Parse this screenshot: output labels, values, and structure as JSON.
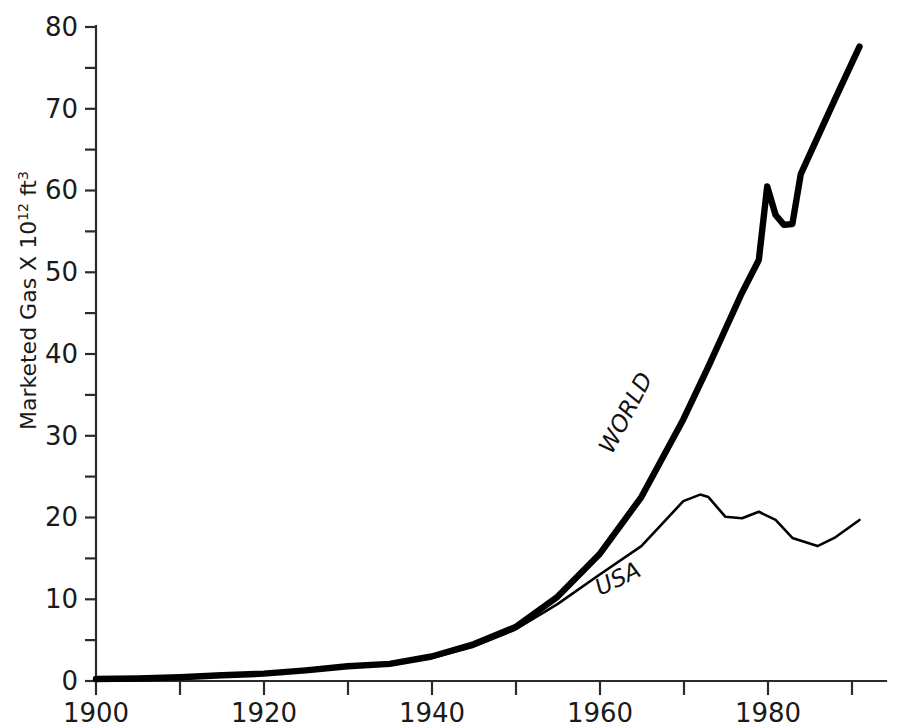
{
  "chart_data": {
    "type": "line",
    "title": "",
    "xlabel": "",
    "ylabel": "Marketed Gas X 10^12 ft^3",
    "ylabel_prefix": "Marketed Gas X 10",
    "ylabel_exponent": "12",
    "ylabel_unit": " ft",
    "ylabel_unit_exponent": "3",
    "xlim": [
      1900,
      1994
    ],
    "ylim": [
      0,
      80
    ],
    "grid": false,
    "legend_position": "inline-annotation",
    "x_ticks": [
      1900,
      1910,
      1920,
      1930,
      1940,
      1950,
      1960,
      1970,
      1980,
      1990
    ],
    "x_tick_labels": [
      "1900",
      "",
      "1920",
      "",
      "1940",
      "",
      "1960",
      "",
      "1980",
      ""
    ],
    "y_ticks": [
      0,
      5,
      10,
      15,
      20,
      25,
      30,
      35,
      40,
      45,
      50,
      55,
      60,
      65,
      70,
      75,
      80
    ],
    "y_tick_labels": [
      "0",
      "",
      "10",
      "",
      "20",
      "",
      "30",
      "",
      "40",
      "",
      "50",
      "",
      "60",
      "",
      "70",
      "",
      "80"
    ],
    "series": [
      {
        "name": "WORLD",
        "label": "WORLD",
        "style": "thick",
        "x": [
          1900,
          1905,
          1910,
          1915,
          1920,
          1925,
          1930,
          1935,
          1940,
          1945,
          1950,
          1955,
          1960,
          1965,
          1970,
          1973,
          1975,
          1977,
          1979,
          1980,
          1981,
          1982,
          1983,
          1984,
          1986,
          1988,
          1991
        ],
        "values": [
          0.25,
          0.3,
          0.45,
          0.7,
          0.9,
          1.3,
          1.8,
          2.1,
          3.0,
          4.5,
          6.6,
          10.3,
          15.5,
          22.5,
          32.0,
          38.5,
          43.0,
          47.5,
          51.5,
          60.5,
          57.0,
          55.8,
          55.9,
          62.0,
          66.5,
          71.0,
          77.6
        ]
      },
      {
        "name": "USA",
        "label": "USA",
        "style": "thin",
        "x": [
          1900,
          1910,
          1920,
          1930,
          1940,
          1945,
          1950,
          1955,
          1960,
          1965,
          1970,
          1972,
          1973,
          1975,
          1977,
          1979,
          1981,
          1983,
          1986,
          1988,
          1991
        ],
        "values": [
          0.2,
          0.45,
          0.85,
          1.75,
          2.8,
          4.2,
          6.3,
          9.4,
          13.0,
          16.5,
          22.0,
          22.8,
          22.5,
          20.1,
          19.9,
          20.7,
          19.7,
          17.5,
          16.5,
          17.5,
          19.7
        ]
      }
    ]
  }
}
